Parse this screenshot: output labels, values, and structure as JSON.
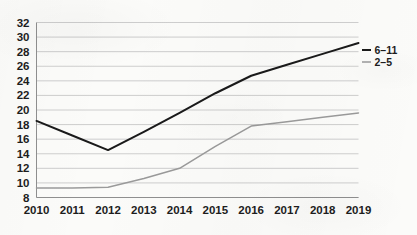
{
  "chart_data": {
    "type": "line",
    "title": "",
    "subtitle": "",
    "xlabel": "",
    "ylabel": "",
    "x": [
      2010,
      2011,
      2012,
      2013,
      2014,
      2015,
      2016,
      2017,
      2018,
      2019
    ],
    "categories": [
      "2010",
      "2011",
      "2012",
      "2013",
      "2014",
      "2015",
      "2016",
      "2017",
      "2018",
      "2019"
    ],
    "series": [
      {
        "name": "6–11",
        "color": "#1a1a1a",
        "values": [
          18.5,
          16.5,
          14.5,
          17.0,
          19.6,
          22.3,
          24.7,
          26.2,
          27.7,
          29.2
        ]
      },
      {
        "name": "2–5",
        "color": "#9a9a9a",
        "values": [
          9.3,
          9.3,
          9.4,
          10.6,
          12.0,
          15.0,
          17.8,
          18.4,
          19.0,
          19.6
        ]
      }
    ],
    "ylim": [
      8,
      32
    ],
    "yticks": [
      8,
      10,
      12,
      14,
      16,
      18,
      20,
      22,
      24,
      26,
      28,
      30,
      32
    ],
    "ytick_labels": [
      "8",
      "10",
      "12",
      "14",
      "16",
      "18",
      "20",
      "22",
      "24",
      "26",
      "28",
      "30",
      "32"
    ],
    "xtick_labels": [
      "2010",
      "2011",
      "2012",
      "2013",
      "2014",
      "2015",
      "2016",
      "2017",
      "2018",
      "2019"
    ],
    "grid": "horizontal",
    "legend_position": "right",
    "legend": [
      {
        "label": "6–11",
        "color": "#1a1a1a"
      },
      {
        "label": "2–5",
        "color": "#9a9a9a"
      }
    ],
    "colors": {
      "background": "#fbfbf9",
      "gridline": "#c8c8c8",
      "axis": "#8f8f8f",
      "text": "#1d1d1d",
      "series_6_11": "#1a1a1a",
      "series_2_5": "#9a9a9a"
    }
  }
}
